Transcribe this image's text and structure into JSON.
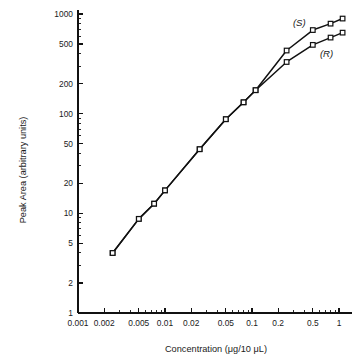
{
  "chart_data": {
    "type": "line",
    "title": "",
    "xlabel": "Concentration (μg/10 μL)",
    "ylabel": "Peak Area (arbitrary units)",
    "xscale": "log",
    "yscale": "log",
    "xlim": [
      0.001,
      1.4
    ],
    "ylim": [
      1,
      1100
    ],
    "grid": false,
    "legend_position": "inline-annotation",
    "xticks": [
      0.001,
      0.002,
      0.005,
      0.01,
      0.02,
      0.05,
      0.1,
      0.2,
      0.5,
      1
    ],
    "xtick_labels": [
      "0.001",
      "0.002",
      "0.005",
      "0.01",
      "0.02",
      "0.05",
      "0.1",
      "0.2",
      "0.5",
      "1"
    ],
    "yticks": [
      1,
      2,
      5,
      10,
      20,
      50,
      100,
      200,
      500,
      1000
    ],
    "ytick_labels": [
      "1",
      "2",
      "5",
      "10",
      "20",
      "50",
      "100",
      "200",
      "500",
      "1000"
    ],
    "marker": "open-square",
    "series": [
      {
        "name": "(S)",
        "label": "(S)",
        "color": "#111111",
        "x": [
          0.0025,
          0.005,
          0.0075,
          0.01,
          0.025,
          0.05,
          0.08,
          0.11,
          0.25,
          0.5,
          0.8,
          1.1
        ],
        "y": [
          4.0,
          8.8,
          12.5,
          17.0,
          44.0,
          88.0,
          130.0,
          172.0,
          430.0,
          690.0,
          800.0,
          900.0
        ]
      },
      {
        "name": "(R)",
        "label": "(R)",
        "color": "#111111",
        "x": [
          0.0025,
          0.005,
          0.0075,
          0.01,
          0.025,
          0.05,
          0.08,
          0.11,
          0.25,
          0.5,
          0.8,
          1.1
        ],
        "y": [
          4.0,
          8.8,
          12.5,
          17.0,
          44.0,
          88.0,
          130.0,
          172.0,
          330.0,
          490.0,
          580.0,
          650.0
        ]
      }
    ],
    "annotations": [
      {
        "text": "(S)",
        "x": 0.35,
        "y": 760
      },
      {
        "text": "(R)",
        "x": 0.72,
        "y": 370
      }
    ]
  }
}
